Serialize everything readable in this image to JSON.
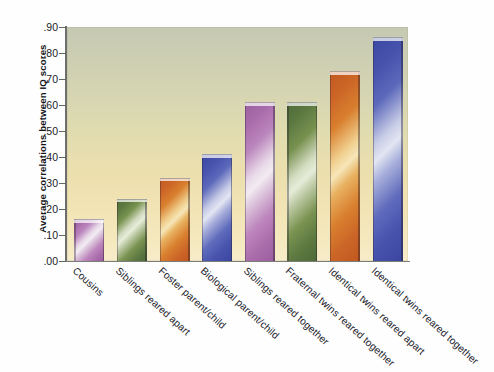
{
  "chart_data": {
    "type": "bar",
    "title": "",
    "xlabel": "",
    "ylabel": "Average correlations between IQ scores",
    "ylim": [
      0.0,
      0.9
    ],
    "grid": false,
    "legend": "none",
    "categories": [
      "Cousins",
      "Siblings reared apart",
      "Foster parent/child",
      "Biological parent/child",
      "Siblings reared together",
      "Fraternal twins reared together",
      "Identical twins reared apart",
      "Identical twins reared together"
    ],
    "values": [
      0.16,
      0.24,
      0.32,
      0.41,
      0.61,
      0.61,
      0.73,
      0.86
    ],
    "bar_colors": [
      "#a96cab",
      "#5d7941",
      "#cc6527",
      "#4652ab",
      "#a96cab",
      "#5d7941",
      "#cc6527",
      "#4652ab"
    ],
    "ytick_labels": [
      ".90",
      ".80",
      ".70",
      ".60",
      ".50",
      ".40",
      ".30",
      ".20",
      ".10",
      ".00"
    ],
    "ytick_values": [
      0.9,
      0.8,
      0.7,
      0.6,
      0.5,
      0.4,
      0.3,
      0.2,
      0.1,
      0.0
    ]
  },
  "colors": {
    "panel_top": "#c6c9b2",
    "panel_bottom": "#f6ecc8",
    "axis": "#6d6f6c",
    "text": "#1a1b1f",
    "purple": "#a96cab",
    "green": "#5d7941",
    "orange": "#cc6527",
    "blue": "#4652ab"
  }
}
